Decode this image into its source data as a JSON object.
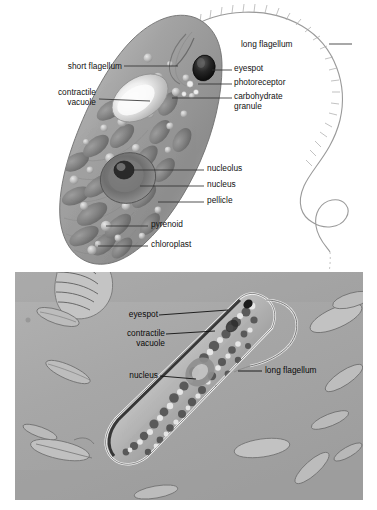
{
  "figure": {
    "background_color": "#ffffff"
  },
  "diagram": {
    "name": "euglena-illustration",
    "organism": "Euglena",
    "background_color": "#ffffff",
    "cell_color": "#9a9a9a",
    "labels": [
      {
        "id": "short-flagellum",
        "text": "short flagellum",
        "align": "right",
        "x": 120,
        "y": 62,
        "leader": [
          [
            124,
            66
          ],
          [
            176,
            66
          ]
        ]
      },
      {
        "id": "contractile-vacuole",
        "text": "contractile\nvacuole",
        "align": "right",
        "x": 95,
        "y": 90,
        "leader": [
          [
            99,
            99
          ],
          [
            148,
            101
          ]
        ]
      },
      {
        "id": "long-flagellum",
        "text": "long flagellum",
        "align": "left",
        "x": 241,
        "y": 42,
        "leader": [
          [
            329,
            47
          ],
          [
            352,
            47
          ]
        ]
      },
      {
        "id": "eyespot",
        "text": "eyespot",
        "align": "left",
        "x": 234,
        "y": 65,
        "leader": [
          [
            212,
            70
          ],
          [
            232,
            70
          ]
        ]
      },
      {
        "id": "photoreceptor",
        "text": "photoreceptor",
        "align": "left",
        "x": 234,
        "y": 79,
        "leader": [
          [
            198,
            84
          ],
          [
            232,
            84
          ]
        ]
      },
      {
        "id": "carbohydrate-granule",
        "text": "carbohydrate\ngranule",
        "align": "left",
        "x": 234,
        "y": 93,
        "leader": [
          [
            170,
            98
          ],
          [
            232,
            98
          ]
        ]
      },
      {
        "id": "nucleolus",
        "text": "nucleolus",
        "align": "left",
        "x": 206,
        "y": 165,
        "leader": [
          [
            134,
            170
          ],
          [
            204,
            170
          ]
        ]
      },
      {
        "id": "nucleus",
        "text": "nucleus",
        "align": "left",
        "x": 206,
        "y": 181,
        "leader": [
          [
            140,
            186
          ],
          [
            204,
            186
          ]
        ]
      },
      {
        "id": "pellicle",
        "text": "pellicle",
        "align": "left",
        "x": 206,
        "y": 197,
        "leader": [
          [
            158,
            202
          ],
          [
            204,
            202
          ]
        ]
      },
      {
        "id": "pyrenoid",
        "text": "pyrenoid",
        "align": "left",
        "x": 150,
        "y": 221,
        "leader": [
          [
            106,
            226
          ],
          [
            148,
            226
          ]
        ]
      },
      {
        "id": "chloroplast",
        "text": "chloroplast",
        "align": "left",
        "x": 150,
        "y": 241,
        "leader": [
          [
            98,
            246
          ],
          [
            148,
            246
          ]
        ]
      }
    ]
  },
  "photomicrograph": {
    "name": "euglena-photomicrograph",
    "background_color": "#a9a9a9",
    "panel": {
      "x": 15,
      "y": 272,
      "width": 348,
      "height": 228
    },
    "labels": [
      {
        "id": "photo-eyespot",
        "text": "eyespot",
        "align": "right",
        "x": 128,
        "y": 313,
        "leader": [
          [
            131,
            317
          ],
          [
            221,
            313
          ]
        ]
      },
      {
        "id": "photo-contractile-vacuole",
        "text": "contractile\nvacuole",
        "align": "right",
        "x": 133,
        "y": 331,
        "leader": [
          [
            136,
            336
          ],
          [
            211,
            333
          ]
        ]
      },
      {
        "id": "photo-nucleus",
        "text": "nucleus",
        "align": "right",
        "x": 128,
        "y": 372,
        "leader": [
          [
            131,
            377
          ],
          [
            168,
            378
          ]
        ]
      },
      {
        "id": "photo-long-flagellum",
        "text": "long flagellum",
        "align": "left",
        "x": 265,
        "y": 368,
        "leader": [
          [
            236,
            373
          ],
          [
            262,
            373
          ]
        ]
      }
    ]
  }
}
